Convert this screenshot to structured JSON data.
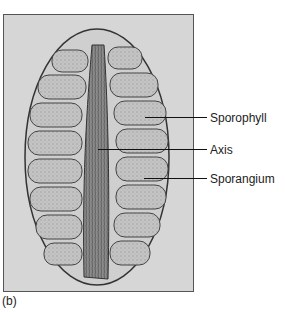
{
  "figure": {
    "panel_label": "(b)",
    "labels": [
      {
        "text": "Sporophyll"
      },
      {
        "text": "Axis"
      },
      {
        "text": "Sporangium"
      }
    ],
    "colors": {
      "background": "#d6d6d6",
      "tissue": "#bdbdbd",
      "axis": "#7a7a7a",
      "outline": "#333333"
    }
  }
}
